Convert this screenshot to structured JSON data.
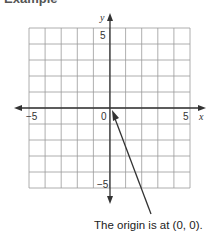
{
  "header": {
    "title": "Example"
  },
  "graph": {
    "x_axis_label": "x",
    "y_axis_label": "y",
    "tick_labels": {
      "x_neg": "−5",
      "x_pos": "5",
      "origin": "0",
      "y_pos": "5",
      "y_neg": "−5"
    },
    "grid": {
      "xmin": -5,
      "xmax": 5,
      "ymin": -5,
      "ymax": 5,
      "step": 1
    },
    "colors": {
      "grid": "#9a9a9a",
      "axis": "#333333",
      "pointer": "#333333"
    }
  },
  "annotation": {
    "text": "The origin is at (0, 0).",
    "points_to": [
      0,
      0
    ]
  }
}
